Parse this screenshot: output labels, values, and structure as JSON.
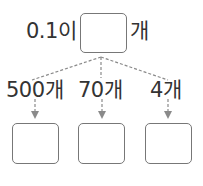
{
  "top": {
    "prefix": "0.1이",
    "suffix": "개"
  },
  "labels": [
    "500개",
    "70개",
    "4개"
  ],
  "colors": {
    "line": "#888888",
    "box": "#777777",
    "text": "#333333"
  }
}
